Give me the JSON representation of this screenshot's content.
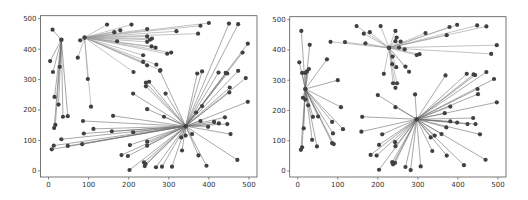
{
  "colors": {
    "background": "#ffffff",
    "axes_frame": "#555555",
    "edge": "#6e6e6e",
    "edge_light": "#9a9a9a",
    "node": "#404040"
  },
  "chart_data": [
    {
      "type": "scatter",
      "title": "",
      "xlabel": "",
      "ylabel": "",
      "xlim": [
        -20,
        520
      ],
      "ylim": [
        -20,
        510
      ],
      "xticks": [
        0,
        100,
        200,
        300,
        400,
        500
      ],
      "yticks": [
        0,
        100,
        200,
        300,
        400,
        500
      ],
      "grid": false,
      "legend": null,
      "frame_px": {
        "left": 40.5,
        "top": 15.7,
        "right": 257,
        "bottom": 177
      },
      "hubs": [
        {
          "name": "hub-a",
          "x": 32,
          "y": 431,
          "spokes": [
            [
              10,
              464
            ],
            [
              4,
              361
            ],
            [
              11,
              325
            ],
            [
              15,
              243
            ],
            [
              25,
              218
            ],
            [
              17,
              151
            ],
            [
              14,
              141
            ],
            [
              36,
              178
            ],
            [
              48,
              180
            ],
            [
              28,
              342
            ]
          ]
        },
        {
          "name": "hub-b",
          "x": 90,
          "y": 438,
          "spokes": [
            [
              79,
              429
            ],
            [
              73,
              372
            ],
            [
              98,
              302
            ],
            [
              106,
              211
            ],
            [
              146,
              481
            ],
            [
              207,
              481
            ],
            [
              164,
              456
            ],
            [
              179,
              462
            ],
            [
              246,
              466
            ],
            [
              319,
              459
            ],
            [
              379,
              477
            ],
            [
              400,
              486
            ],
            [
              373,
              451
            ],
            [
              171,
              426
            ],
            [
              246,
              442
            ],
            [
              253,
              431
            ],
            [
              258,
              435
            ],
            [
              246,
              424
            ],
            [
              257,
              409
            ],
            [
              267,
              405
            ],
            [
              296,
              385
            ],
            [
              306,
              389
            ],
            [
              236,
              380
            ],
            [
              236,
              358
            ],
            [
              246,
              347
            ],
            [
              269,
              349
            ],
            [
              212,
              325
            ],
            [
              279,
              331
            ]
          ]
        },
        {
          "name": "hub-c",
          "x": 342,
          "y": 147,
          "spokes": [
            [
              371,
              320
            ],
            [
              450,
              484
            ],
            [
              473,
              482
            ],
            [
              497,
              418
            ],
            [
              484,
              389
            ],
            [
              424,
              323
            ],
            [
              442,
              322
            ],
            [
              446,
              320
            ],
            [
              473,
              329
            ],
            [
              492,
              305
            ],
            [
              452,
              274
            ],
            [
              451,
              258
            ],
            [
              497,
              227
            ],
            [
              383,
              327
            ],
            [
              368,
              192
            ],
            [
              383,
              213
            ],
            [
              379,
              164
            ],
            [
              440,
              176
            ],
            [
              413,
              161
            ],
            [
              425,
              156
            ],
            [
              446,
              154
            ],
            [
              398,
              145
            ],
            [
              454,
              121
            ],
            [
              358,
              121
            ],
            [
              331,
              110
            ],
            [
              342,
              116
            ],
            [
              333,
              67
            ],
            [
              374,
              51
            ],
            [
              394,
              17
            ],
            [
              471,
              36
            ],
            [
              308,
              14
            ],
            [
              283,
              14
            ],
            [
              268,
              12
            ],
            [
              242,
              23
            ],
            [
              238,
              28
            ],
            [
              240,
              16
            ],
            [
              246,
              83
            ],
            [
              246,
              96
            ],
            [
              203,
              85
            ],
            [
              198,
              49
            ],
            [
              182,
              52
            ],
            [
              202,
              3
            ],
            [
              211,
              254
            ],
            [
              243,
              290
            ],
            [
              251,
              293
            ],
            [
              243,
              278
            ],
            [
              246,
              203
            ],
            [
              288,
              178
            ],
            [
              292,
              254
            ],
            [
              278,
              329
            ],
            [
              161,
              181
            ],
            [
              86,
              164
            ],
            [
              88,
              123
            ],
            [
              112,
              138
            ],
            [
              158,
              130
            ],
            [
              211,
              127
            ],
            [
              32,
              104
            ],
            [
              13,
              83
            ],
            [
              8,
              71
            ],
            [
              48,
              82
            ],
            [
              84,
              88
            ]
          ]
        }
      ]
    },
    {
      "type": "scatter",
      "title": "",
      "xlabel": "",
      "ylabel": "",
      "xlim": [
        -20,
        520
      ],
      "ylim": [
        -20,
        510
      ],
      "xticks": [
        0,
        100,
        200,
        300,
        400,
        500
      ],
      "yticks": [
        0,
        100,
        200,
        300,
        400,
        500
      ],
      "grid": false,
      "legend": null,
      "frame_px": {
        "left": 289.7,
        "top": 16.7,
        "right": 506,
        "bottom": 177
      },
      "hubs": [
        {
          "name": "hub-d",
          "x": 19,
          "y": 271,
          "spokes": [
            [
              9,
              463
            ],
            [
              4,
              359
            ],
            [
              11,
              324
            ],
            [
              19,
              324
            ],
            [
              30,
              417
            ],
            [
              28,
              337
            ],
            [
              73,
              369
            ],
            [
              100,
              300
            ],
            [
              108,
              211
            ],
            [
              113,
              138
            ],
            [
              88,
              124
            ],
            [
              86,
              162
            ],
            [
              23,
              329
            ],
            [
              13,
              242
            ],
            [
              15,
              141
            ],
            [
              11,
              78
            ],
            [
              8,
              70
            ],
            [
              36,
              103
            ],
            [
              48,
              81
            ],
            [
              38,
              179
            ],
            [
              51,
              180
            ],
            [
              86,
              92
            ],
            [
              90,
              89
            ],
            [
              26,
              217
            ],
            [
              19,
              236
            ]
          ]
        },
        {
          "name": "hub-e",
          "x": 228,
          "y": 407,
          "spokes": [
            [
              147,
              479
            ],
            [
              207,
              479
            ],
            [
              165,
              454
            ],
            [
              180,
              459
            ],
            [
              244,
              463
            ],
            [
              82,
              427
            ],
            [
              118,
              426
            ],
            [
              169,
              422
            ],
            [
              319,
              456
            ],
            [
              379,
              476
            ],
            [
              398,
              483
            ],
            [
              372,
              449
            ],
            [
              448,
              481
            ],
            [
              471,
              478
            ],
            [
              497,
              416
            ],
            [
              483,
              387
            ],
            [
              297,
              383
            ],
            [
              304,
              386
            ],
            [
              247,
              441
            ],
            [
              257,
              428
            ],
            [
              244,
              429
            ],
            [
              267,
              402
            ],
            [
              253,
              408
            ],
            [
              215,
              321
            ],
            [
              237,
              378
            ],
            [
              236,
              353
            ],
            [
              246,
              343
            ],
            [
              269,
              345
            ],
            [
              278,
              328
            ],
            [
              238,
              290
            ],
            [
              244,
              275
            ],
            [
              248,
              290
            ]
          ]
        },
        {
          "name": "hub-f",
          "x": 297,
          "y": 171,
          "spokes": [
            [
              369,
              316
            ],
            [
              422,
              321
            ],
            [
              439,
              319
            ],
            [
              443,
              317
            ],
            [
              471,
              327
            ],
            [
              490,
              304
            ],
            [
              449,
              271
            ],
            [
              450,
              254
            ],
            [
              497,
              227
            ],
            [
              381,
              213
            ],
            [
              367,
              191
            ],
            [
              293,
              253
            ],
            [
              200,
              251
            ],
            [
              161,
              179
            ],
            [
              159,
              130
            ],
            [
              211,
              121
            ],
            [
              244,
              211
            ],
            [
              381,
              164
            ],
            [
              398,
              160
            ],
            [
              424,
              155
            ],
            [
              444,
              155
            ],
            [
              438,
              175
            ],
            [
              371,
              144
            ],
            [
              455,
              121
            ],
            [
              359,
              122
            ],
            [
              342,
              117
            ],
            [
              332,
              111
            ],
            [
              336,
              66
            ],
            [
              372,
              51
            ],
            [
              415,
              19
            ],
            [
              469,
              37
            ],
            [
              307,
              15
            ],
            [
              282,
              3
            ],
            [
              269,
              13
            ],
            [
              243,
              27
            ],
            [
              238,
              22
            ],
            [
              236,
              29
            ],
            [
              243,
              95
            ],
            [
              244,
              82
            ],
            [
              203,
              86
            ],
            [
              197,
              51
            ],
            [
              182,
              53
            ],
            [
              203,
              4
            ]
          ]
        }
      ]
    }
  ]
}
